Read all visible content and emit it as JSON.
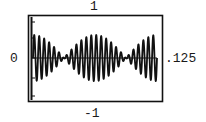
{
  "chart_data": {
    "type": "line",
    "title": "",
    "xlabel": "",
    "ylabel": "",
    "x_range": [
      0,
      0.125
    ],
    "ylim": [
      -1,
      1
    ],
    "y_tick_labels": {
      "top": "1",
      "middle": "0",
      "bottom": "-1"
    },
    "x_end_label": ".125",
    "grid": false,
    "legend": null,
    "series": [
      {
        "name": "signal",
        "model": "y = A * cos(pi * fb * t) * sin(2 * pi * fc * t)",
        "A": 0.55,
        "fc_hz": 200,
        "fb_hz": 16,
        "samples": 1200
      }
    ],
    "colors": {
      "frame": "#111111",
      "line": "#111111",
      "background": "#ffffff"
    }
  },
  "labels": {
    "y_top": "1",
    "y_zero": "0",
    "y_bottom": "-1",
    "x_end": ".125"
  }
}
